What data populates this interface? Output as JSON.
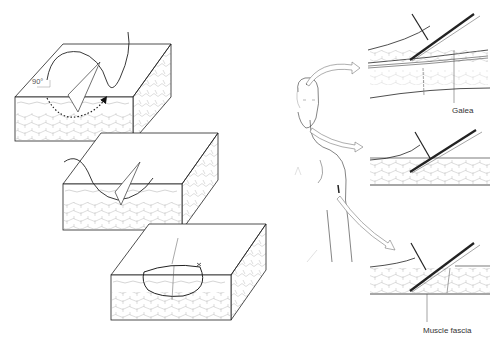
{
  "figure": {
    "left_panel": {
      "description": "Three-step suture technique on skin blocks",
      "steps": [
        {
          "step": 1,
          "angle_label": "90°"
        },
        {
          "step": 2
        },
        {
          "step": 3
        }
      ]
    },
    "right_panel": {
      "description": "Anatomical site dissections with forceps and scissors",
      "labels": {
        "galea": "Galea",
        "muscle_fascia": "Muscle fascia"
      }
    }
  }
}
